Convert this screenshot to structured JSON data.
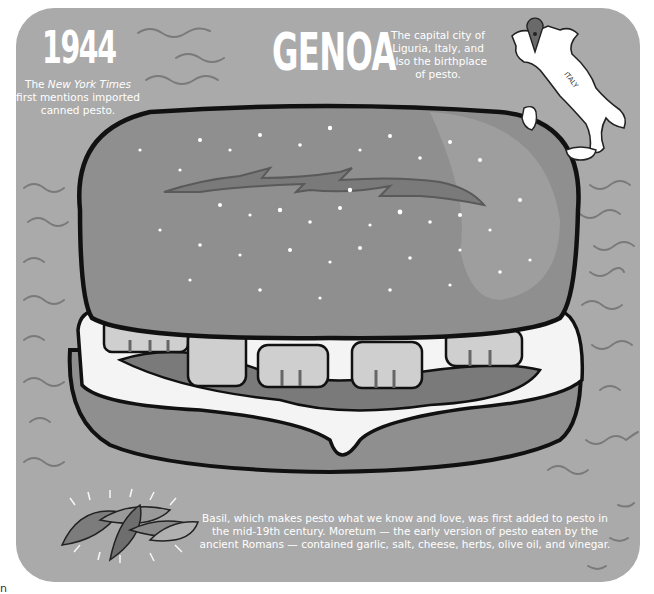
{
  "poster": {
    "background_color": "#aaaaaa",
    "year": {
      "label": "1944",
      "note_prefix": "The ",
      "note_italic": "New York Times",
      "note_suffix": " first mentions imported canned pesto."
    },
    "city": {
      "label": "GENOA",
      "note": "The capital city of Liguria, Italy, and also the birthplace of pesto."
    },
    "map": {
      "country_label": "ITALY",
      "pin_icon": "location-pin-icon"
    },
    "illustration": {
      "subject": "sandwich-icon",
      "garnish": "basil-leaves-icon"
    },
    "bottom_note": "Basil, which makes pesto what we know and love, was first added to pesto in the mid-19th century. Moretum — the early version of pesto eaten by the ancient Romans — contained garlic, salt, cheese, herbs, olive oil, and vinegar.",
    "corner_glyph": "n"
  }
}
